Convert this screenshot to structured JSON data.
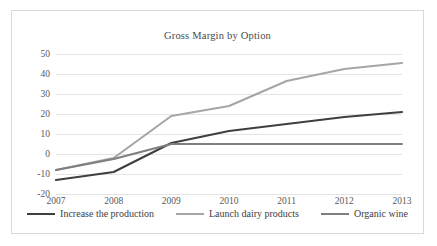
{
  "chart_data": {
    "type": "line",
    "title": "Gross Margin by Option",
    "xlabel": "",
    "ylabel": "",
    "categories": [
      "2007",
      "2008",
      "2009",
      "2010",
      "2011",
      "2012",
      "2013"
    ],
    "ylim": [
      -20,
      50
    ],
    "ytick_labels": [
      "50",
      "40",
      "30",
      "20",
      "10",
      "0",
      "-10",
      "-20"
    ],
    "ytick_values": [
      50,
      40,
      30,
      20,
      10,
      0,
      -10,
      -20
    ],
    "grid": true,
    "legend_position": "bottom",
    "series": [
      {
        "name": "Increase the production",
        "color": "#3f3f3f",
        "width": 2.1,
        "values": [
          -13,
          -9,
          5.5,
          11.5,
          15,
          18.5,
          21
        ]
      },
      {
        "name": "Launch dairy products",
        "color": "#a6a6a6",
        "width": 2.1,
        "values": [
          -8,
          -2,
          19,
          24,
          36.5,
          42.5,
          45.5
        ]
      },
      {
        "name": "Organic wine",
        "color": "#7f7f7f",
        "width": 2.1,
        "values": [
          -8,
          -2.5,
          5,
          5,
          5,
          5,
          5
        ]
      }
    ]
  }
}
